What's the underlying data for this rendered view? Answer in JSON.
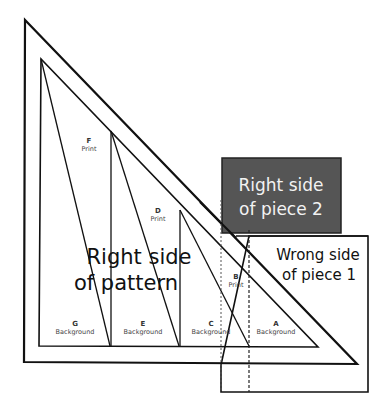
{
  "diagram": {
    "labels": {
      "pattern": [
        "Right side",
        "of pattern"
      ],
      "piece2": [
        "Right side",
        "of piece 2"
      ],
      "piece1": [
        "Wrong side",
        "of piece 1"
      ]
    },
    "sections": [
      {
        "letter": "F",
        "fabric": "Print"
      },
      {
        "letter": "D",
        "fabric": "Print"
      },
      {
        "letter": "B",
        "fabric": "Print"
      },
      {
        "letter": "G",
        "fabric": "Background"
      },
      {
        "letter": "E",
        "fabric": "Background"
      },
      {
        "letter": "C",
        "fabric": "Background"
      },
      {
        "letter": "A",
        "fabric": "Background"
      }
    ],
    "colors": {
      "line": "#111111",
      "piece2_fill": "#555555",
      "piece2_text": "#f2f2f2",
      "background": "#ffffff"
    }
  }
}
